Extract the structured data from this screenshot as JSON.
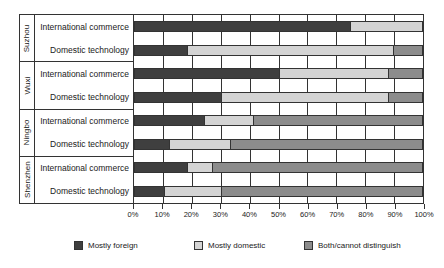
{
  "chart_data": {
    "type": "bar",
    "orientation": "horizontal",
    "stacked": true,
    "normalized_percent": true,
    "title": "",
    "xlabel": "",
    "ylabel": "",
    "xlim": [
      0,
      100
    ],
    "grid": true,
    "legend_position": "bottom",
    "xtick_labels": [
      "0%",
      "10%",
      "20%",
      "30%",
      "40%",
      "50%",
      "60%",
      "70%",
      "80%",
      "90%",
      "100%"
    ],
    "xtick_values": [
      0,
      10,
      20,
      30,
      40,
      50,
      60,
      70,
      80,
      90,
      100
    ],
    "legend": [
      {
        "name": "Mostly foreign",
        "color": "#3f3f3f"
      },
      {
        "name": "Mostly domestic",
        "color": "#d4d4d4"
      },
      {
        "name": "Both/cannot distinguish",
        "color": "#8c8c8c"
      }
    ],
    "series": [
      {
        "name": "Mostly foreign",
        "color": "#3f3f3f",
        "values": [
          75,
          18,
          50,
          30,
          24,
          12,
          18,
          10
        ]
      },
      {
        "name": "Mostly domestic",
        "color": "#d4d4d4",
        "values": [
          25,
          72,
          38,
          58,
          17,
          21,
          9,
          20
        ]
      },
      {
        "name": "Both/cannot distinguish",
        "color": "#8c8c8c",
        "values": [
          0,
          10,
          12,
          12,
          59,
          67,
          73,
          70
        ]
      }
    ],
    "categories": [
      "Suzhou – International commerce",
      "Suzhou – Domestic technology",
      "Wuxi – International commerce",
      "Wuxi – Domestic technology",
      "Ningbo – International commerce",
      "Ningbo – Domestic technology",
      "Shenzhen – International commerce",
      "Shenzhen – Domestic technology"
    ],
    "groups": [
      {
        "city": "Suzhou",
        "rows": [
          {
            "label": "International commerce",
            "segments": [
              75,
              25,
              0
            ]
          },
          {
            "label": "Domestic technology",
            "segments": [
              18,
              72,
              10
            ]
          }
        ]
      },
      {
        "city": "Wuxi",
        "rows": [
          {
            "label": "International commerce",
            "segments": [
              50,
              38,
              12
            ]
          },
          {
            "label": "Domestic technology",
            "segments": [
              30,
              58,
              12
            ]
          }
        ]
      },
      {
        "city": "Ningbo",
        "rows": [
          {
            "label": "International commerce",
            "segments": [
              24,
              17,
              59
            ]
          },
          {
            "label": "Domestic technology",
            "segments": [
              12,
              21,
              67
            ]
          }
        ]
      },
      {
        "city": "Shenzhen",
        "rows": [
          {
            "label": "International commerce",
            "segments": [
              18,
              9,
              73
            ]
          },
          {
            "label": "Domestic technology",
            "segments": [
              10,
              20,
              70
            ]
          }
        ]
      }
    ]
  },
  "colors": {
    "mostly_foreign": "#3f3f3f",
    "mostly_domestic": "#d4d4d4",
    "both_cannot_distinguish": "#8c8c8c",
    "outline": "#333333",
    "background": "#ffffff"
  }
}
